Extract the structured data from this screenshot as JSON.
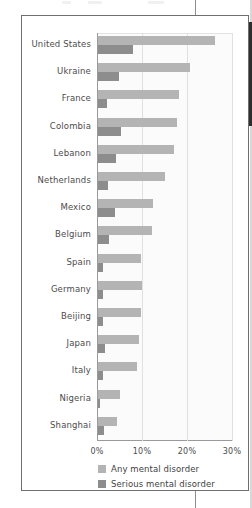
{
  "figure": {
    "axis": {
      "x_ticks": [
        "0%",
        "10%",
        "20%",
        "30%"
      ],
      "x_tick_values": [
        0,
        10,
        20,
        30
      ]
    },
    "legend": {
      "items": [
        {
          "label": "Any mental disorder",
          "color": "#b4b4b4",
          "key": "any"
        },
        {
          "label": "Serious mental disorder",
          "color": "#8d8d8d",
          "key": "serious"
        }
      ]
    }
  },
  "chart_data": {
    "type": "bar",
    "orientation": "horizontal",
    "title": "",
    "subtitle": "",
    "xlabel": "",
    "ylabel": "",
    "xlim": [
      0,
      30
    ],
    "x_unit": "%",
    "grid": true,
    "grid_axis": "x",
    "legend_position": "bottom",
    "categories": [
      "United States",
      "Ukraine",
      "France",
      "Colombia",
      "Lebanon",
      "Netherlands",
      "Mexico",
      "Belgium",
      "Spain",
      "Germany",
      "Beijing",
      "Japan",
      "Italy",
      "Nigeria",
      "Shanghai"
    ],
    "series": [
      {
        "name": "Any mental disorder",
        "color": "#b4b4b4",
        "values": [
          26.0,
          20.4,
          18.0,
          17.5,
          16.9,
          14.9,
          12.2,
          12.0,
          9.6,
          9.8,
          9.6,
          9.2,
          8.6,
          4.8,
          4.2
        ]
      },
      {
        "name": "Serious mental disorder",
        "color": "#8d8d8d",
        "values": [
          7.7,
          4.7,
          2.0,
          5.2,
          4.0,
          2.3,
          3.7,
          2.4,
          1.2,
          1.2,
          1.0,
          1.5,
          1.2,
          0.4,
          1.3
        ]
      }
    ]
  }
}
